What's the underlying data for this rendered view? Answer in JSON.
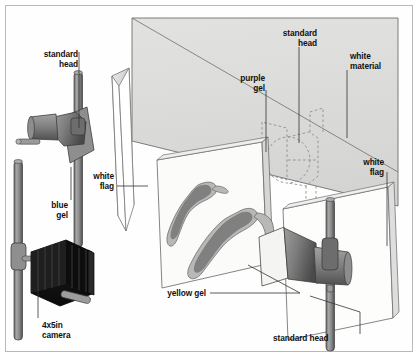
{
  "diagram": {
    "background_color": "#ffffff",
    "frame_color": "#b9b9b9",
    "ink_color": "#111111",
    "palette": {
      "backdrop_fill": "#dcdcda",
      "backdrop_stroke": "#6f6f6f",
      "flag_fill": "#ffffff",
      "flag_edge": "#d2d2d0",
      "flag_stroke": "#7a7a7a",
      "metal_light": "#9a9a9a",
      "metal_mid": "#7b7b7b",
      "metal_dark": "#4f4f4f",
      "camera_body": "#1d1d1d",
      "shoe_fill": "#b6b6b4",
      "shoe_shadow": "#7c7c7a",
      "dashed_stroke": "#888888",
      "leader_line": "#333333"
    },
    "labels": [
      {
        "id": "standard-head-left",
        "text": "standard\nhead",
        "align": "right",
        "x": 16,
        "y": 49,
        "width": 62,
        "leader": {
          "x1": 79,
          "y1": 52,
          "x2": 79,
          "y2": 128
        }
      },
      {
        "id": "white-flag-left",
        "text": "white\nflag",
        "align": "right",
        "x": 72,
        "y": 171,
        "width": 42,
        "leader": {
          "x1": 117,
          "y1": 186,
          "x2": 148,
          "y2": 186
        }
      },
      {
        "id": "blue-gel",
        "text": "blue\ngel",
        "align": "right",
        "x": 28,
        "y": 200,
        "width": 40,
        "leader": {
          "x1": 71,
          "y1": 204,
          "x2": 71,
          "y2": 170
        }
      },
      {
        "id": "camera",
        "text": "4x5in\ncamera",
        "align": "left",
        "x": 42,
        "y": 320,
        "width": 54,
        "leader": {
          "x1": 38,
          "y1": 322,
          "x2": 38,
          "y2": 289
        }
      },
      {
        "id": "purple-gel",
        "text": "purple\ngel",
        "align": "right",
        "x": 219,
        "y": 73,
        "width": 46,
        "leader": {
          "x1": 266,
          "y1": 90,
          "x2": 266,
          "y2": 152
        }
      },
      {
        "id": "standard-head-top",
        "text": "standard\nhead",
        "align": "right",
        "x": 259,
        "y": 28,
        "width": 58,
        "leader": {
          "x1": 299,
          "y1": 47,
          "x2": 299,
          "y2": 143
        }
      },
      {
        "id": "white-material",
        "text": "white\nmaterial",
        "align": "left",
        "x": 350,
        "y": 51,
        "width": 56,
        "leader": {
          "x1": 347,
          "y1": 70,
          "x2": 347,
          "y2": 138
        }
      },
      {
        "id": "white-flag-right",
        "text": "white\nflag",
        "align": "right",
        "x": 342,
        "y": 157,
        "width": 42,
        "leader": {
          "x1": 387,
          "y1": 172,
          "x2": 387,
          "y2": 246
        }
      },
      {
        "id": "yellow-gel",
        "text": "yellow gel",
        "align": "right",
        "x": 152,
        "y": 289,
        "width": 52,
        "leader": {
          "x1": 210,
          "y1": 293,
          "x2": 300,
          "y2": 293
        }
      },
      {
        "id": "standard-head-bottom",
        "text": "standard head",
        "align": "left",
        "x": 273,
        "y": 334,
        "width": 80,
        "leader": {
          "x1": 360,
          "y1": 337,
          "x2": 360,
          "y2": 312
        }
      }
    ],
    "objects": [
      {
        "id": "backdrop",
        "name": "white-material-backdrop"
      },
      {
        "id": "flag-left",
        "name": "white-flag-left-panel"
      },
      {
        "id": "flag-right",
        "name": "white-flag-right-panel"
      },
      {
        "id": "table-panel",
        "name": "shoe-table-panel"
      },
      {
        "id": "light-left",
        "name": "standard-head-left-fixture"
      },
      {
        "id": "light-right",
        "name": "standard-head-right-fixture"
      },
      {
        "id": "light-ghost",
        "name": "standard-head-hidden-outline"
      },
      {
        "id": "camera-rig",
        "name": "large-format-camera"
      },
      {
        "id": "shoe-a",
        "name": "high-heel-shoe-rear"
      },
      {
        "id": "shoe-b",
        "name": "high-heel-shoe-front"
      }
    ]
  }
}
